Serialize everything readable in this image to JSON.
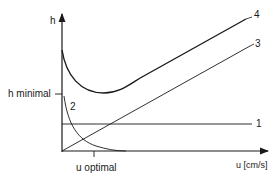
{
  "diagram": {
    "y_axis_label": "h",
    "x_axis_label": "u [cm/s]",
    "h_min_label": "h minimal",
    "u_opt_label": "u optimal",
    "curves": [
      {
        "id": "1",
        "label": "1",
        "shape": "constant"
      },
      {
        "id": "2",
        "label": "2",
        "shape": "decaying"
      },
      {
        "id": "3",
        "label": "3",
        "shape": "linear-increasing"
      },
      {
        "id": "4",
        "label": "4",
        "shape": "sum-with-minimum"
      }
    ],
    "colors": {
      "ink": "#1a1a1a"
    }
  }
}
